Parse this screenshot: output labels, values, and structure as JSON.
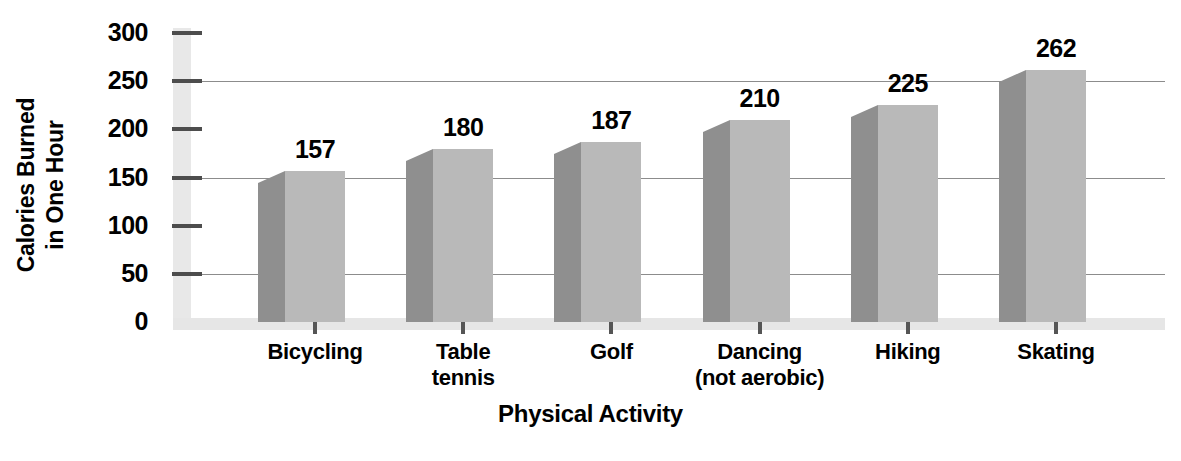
{
  "chart_data": {
    "type": "bar",
    "title": "",
    "xlabel": "Physical Activity",
    "ylabel": "Calories Burned in One Hour",
    "ylabel_lines": [
      "Calories Burned",
      "in One Hour"
    ],
    "categories": [
      "Bicycling",
      "Table tennis",
      "Golf",
      "Dancing (not aerobic)",
      "Hiking",
      "Skating"
    ],
    "category_lines": [
      [
        "Bicycling",
        ""
      ],
      [
        "Table",
        "tennis"
      ],
      [
        "Golf",
        ""
      ],
      [
        "Dancing",
        "(not aerobic)"
      ],
      [
        "Hiking",
        ""
      ],
      [
        "Skating",
        ""
      ]
    ],
    "values": [
      157,
      180,
      187,
      210,
      225,
      262
    ],
    "value_labels": [
      "157",
      "180",
      "187",
      "210",
      "225",
      "262"
    ],
    "ylim": [
      0,
      300
    ],
    "yticks": [
      0,
      50,
      100,
      150,
      200,
      250,
      300
    ],
    "ytick_labels": [
      "0",
      "50",
      "100",
      "150",
      "200",
      "250",
      "300"
    ],
    "gridline_values": [
      50,
      150,
      250
    ],
    "grid": true,
    "legend": "none",
    "style": "3d-column",
    "colors": {
      "bar_front": "#b9b9b9",
      "bar_side": "#8f8f8f",
      "axis_band": "#e8e8e8",
      "gridline": "#8c8c8c",
      "tick": "#4d4d4d",
      "text": "#000000",
      "background": "#ffffff"
    }
  }
}
